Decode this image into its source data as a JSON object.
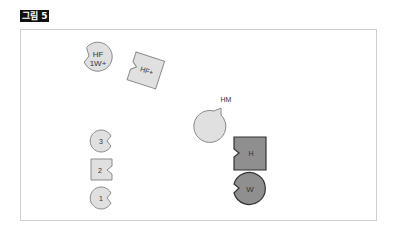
{
  "figure": {
    "label": "그림 5"
  },
  "colors": {
    "light_fill": "#e0e0e0",
    "dark_fill": "#8f8f8f",
    "stroke_light": "#8a8a8a",
    "stroke_dark": "#333333",
    "frame_border": "#cfcfcf"
  },
  "shapes": [
    {
      "id": "hf-1w-plus",
      "type": "notched-circle",
      "label_line1": "HF",
      "label_line2": "1W+",
      "fill": "light"
    },
    {
      "id": "hf-plus",
      "type": "notched-square-rotated",
      "label": "HF+",
      "fill": "light"
    },
    {
      "id": "hm",
      "type": "notched-circle",
      "label": "HM",
      "fill": "light"
    },
    {
      "id": "piece-3",
      "type": "notched-circle",
      "label": "3",
      "fill": "light"
    },
    {
      "id": "piece-2",
      "type": "notched-square",
      "label": "2",
      "fill": "light"
    },
    {
      "id": "piece-1",
      "type": "notched-circle",
      "label": "1",
      "fill": "light"
    },
    {
      "id": "h",
      "type": "notched-square",
      "label": "H",
      "fill": "dark"
    },
    {
      "id": "w",
      "type": "notched-circle",
      "label": "W",
      "fill": "dark"
    }
  ]
}
